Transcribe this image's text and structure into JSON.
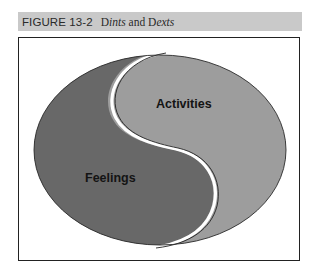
{
  "figure": {
    "number": "FIGURE 13-2",
    "title_parts": [
      {
        "text": "D",
        "italic": false
      },
      {
        "text": "ints",
        "italic": true
      },
      {
        "text": " and D",
        "italic": false
      },
      {
        "text": "exts",
        "italic": true
      }
    ],
    "title": "Dints and Dexts"
  },
  "diagram": {
    "type": "yin-yang ellipse",
    "regions": [
      {
        "label": "Activities",
        "position": "upper-right",
        "color": "#9d9d9d"
      },
      {
        "label": "Feelings",
        "position": "lower-left",
        "color": "#6a6a6a"
      }
    ],
    "header_bg": "#c9c9c9",
    "divider_color": "#ffffff"
  }
}
